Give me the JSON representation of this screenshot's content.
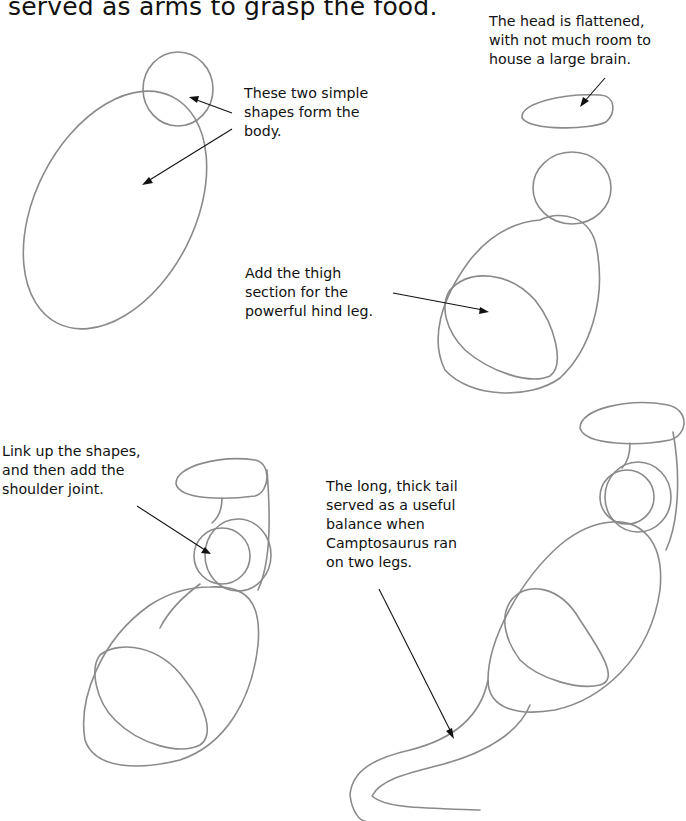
{
  "page": {
    "intro_text": "served as arms to grasp the food.",
    "captions": {
      "step1_body": "These two simple\nshapes form the\nbody.",
      "step2_head": "The head is flattened,\nwith not much room to\nhouse a large brain.",
      "step3_thigh": "Add the thigh\nsection for the\npowerful hind leg.",
      "step4_link": "Link up the shapes,\nand then add the\nshoulder joint.",
      "step5_tail": "The long, thick tail\nserved as a useful\nbalance when\nCamptosaurus ran\non two legs."
    },
    "colors": {
      "pencil": "#8a8a8a",
      "text": "#111111",
      "background": "#ffffff"
    }
  }
}
